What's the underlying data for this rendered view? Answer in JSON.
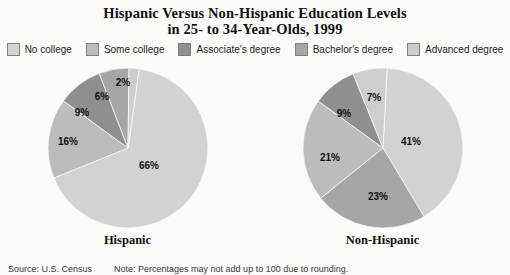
{
  "title": {
    "line1": "Hispanic Versus Non-Hispanic Education Levels",
    "line2": "in 25- to 34-Year-Olds, 1999"
  },
  "legend": {
    "items": [
      {
        "label": "No college",
        "color": "#d2d2d2",
        "swatch_icon": "legend-swatch-icon"
      },
      {
        "label": "Some college",
        "color": "#bcbcbc",
        "swatch_icon": "legend-swatch-icon"
      },
      {
        "label": "Associate's  degree",
        "color": "#8f8f8f",
        "swatch_icon": "legend-swatch-icon"
      },
      {
        "label": "Bachelor's degree",
        "color": "#a6a6a6",
        "swatch_icon": "legend-swatch-icon"
      },
      {
        "label": "Advanced degree",
        "color": "#cdcdcd",
        "swatch_icon": "legend-swatch-icon"
      }
    ]
  },
  "pies": [
    {
      "caption": "Hispanic",
      "labels": [
        "66%",
        "16%",
        "9%",
        "6%",
        "2%"
      ]
    },
    {
      "caption": "Non-Hispanic",
      "labels": [
        "41%",
        "23%",
        "21%",
        "9%",
        "7%"
      ]
    }
  ],
  "footer": {
    "source": "Source: U.S. Census",
    "note": "Note: Percentages may not add up to 100 due to rounding."
  },
  "chart_data": {
    "type": "pie",
    "title": "Hispanic Versus Non-Hispanic Education Levels in 25- to 34-Year-Olds, 1999",
    "categories": [
      "No college",
      "Some college",
      "Associate's degree",
      "Bachelor's degree",
      "Advanced degree"
    ],
    "colors": [
      "#d2d2d2",
      "#bcbcbc",
      "#8f8f8f",
      "#a6a6a6",
      "#cdcdcd"
    ],
    "legend_position": "top",
    "units": "percent",
    "charts": [
      {
        "name": "Hispanic",
        "caption": "Hispanic",
        "values": [
          66,
          16,
          9,
          6,
          2
        ],
        "data_labels": [
          "66%",
          "16%",
          "9%",
          "6%",
          "2%"
        ],
        "total": 99
      },
      {
        "name": "Non-Hispanic",
        "caption": "Non-Hispanic",
        "values": [
          41,
          21,
          9,
          23,
          7
        ],
        "data_labels": [
          "41%",
          "21%",
          "9%",
          "23%",
          "7%"
        ],
        "total": 101
      }
    ],
    "source": "Source: U.S. Census",
    "note": "Note: Percentages may not add up to 100 due to rounding."
  }
}
